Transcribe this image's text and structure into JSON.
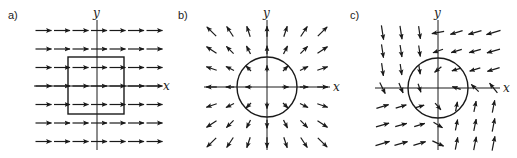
{
  "figure": {
    "panels": [
      {
        "id": "a",
        "label": "a)",
        "x_label": "x",
        "y_label": "y",
        "field": "uniform field pointing in +x direction",
        "boundary": "square",
        "origin": [
          97,
          86
        ],
        "label_pos": [
          8,
          19
        ],
        "boundary_shape": {
          "type": "rect",
          "x": 68,
          "y": 57,
          "w": 56,
          "h": 57
        }
      },
      {
        "id": "b",
        "label": "b)",
        "x_label": "x",
        "y_label": "y",
        "field": "radially outward (source) field",
        "boundary": "circle",
        "origin": [
          267,
          87
        ],
        "label_pos": [
          178,
          19
        ],
        "boundary_shape": {
          "type": "circle",
          "cx": 267,
          "cy": 87,
          "r": 30
        }
      },
      {
        "id": "c",
        "label": "c)",
        "x_label": "x",
        "y_label": "y",
        "field": "rotational/curling field",
        "boundary": "circle",
        "origin": [
          438,
          88
        ],
        "label_pos": [
          350,
          19
        ],
        "boundary_shape": {
          "type": "circle",
          "cx": 438,
          "cy": 88,
          "r": 30
        }
      }
    ],
    "colors": {
      "ink": "#1a1a1a",
      "background": "#ffffff"
    }
  }
}
